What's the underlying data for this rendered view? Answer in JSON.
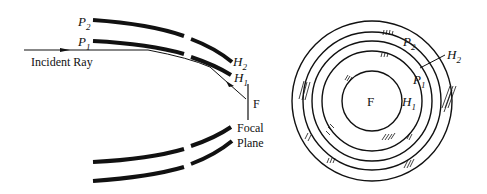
{
  "left_diagram": {
    "incident_ray_label": "Incident Ray",
    "mirror_labels": {
      "p2": {
        "letter": "P",
        "sub": "2"
      },
      "p1": {
        "letter": "P",
        "sub": "1"
      },
      "h2": {
        "letter": "H",
        "sub": "2"
      },
      "h1": {
        "letter": "H",
        "sub": "1"
      }
    },
    "focus_label": "F",
    "focal_plane_label_line1": "Focal",
    "focal_plane_label_line2": "Plane"
  },
  "right_diagram": {
    "focus_label": "F",
    "labels": {
      "p2": {
        "letter": "P",
        "sub": "2"
      },
      "h2": {
        "letter": "H",
        "sub": "2"
      },
      "p1": {
        "letter": "P",
        "sub": "1"
      },
      "h1": {
        "letter": "H",
        "sub": "1"
      }
    }
  },
  "colors": {
    "ink": "#111111",
    "background": "#ffffff"
  }
}
